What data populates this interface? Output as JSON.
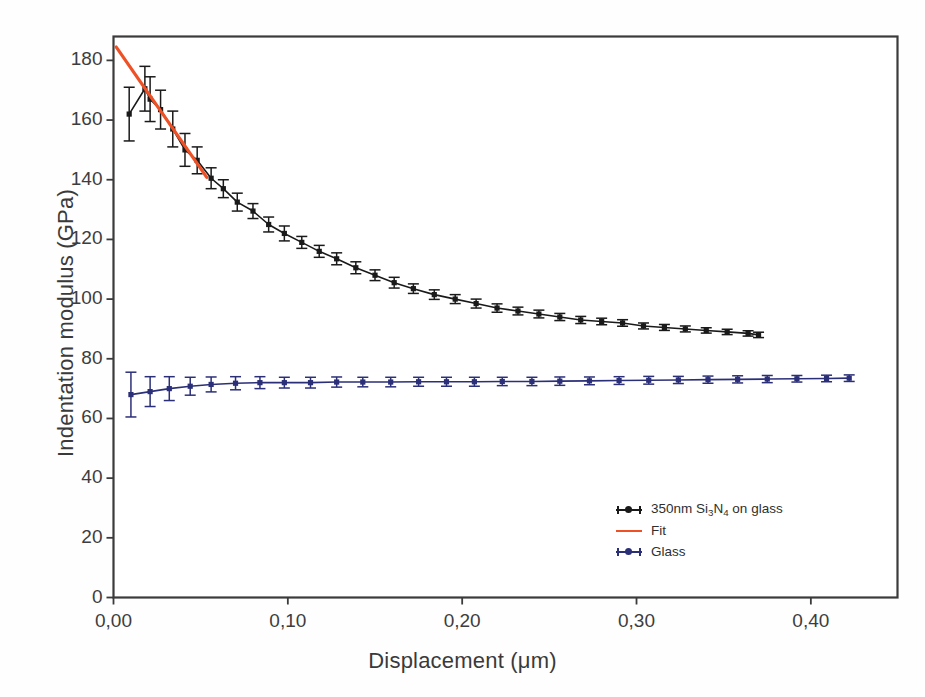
{
  "chart_data": {
    "type": "line",
    "title": "",
    "xlabel": "Displacement (μm)",
    "ylabel": "Indentation modulus (GPa)",
    "xlim": [
      0.0,
      0.4497
    ],
    "ylim": [
      0,
      188
    ],
    "xticks": [
      0.0,
      0.1,
      0.2,
      0.3,
      0.4
    ],
    "xticklabels": [
      "0,00",
      "0,10",
      "0,20",
      "0,30",
      "0,40"
    ],
    "yticks": [
      0,
      20,
      40,
      60,
      80,
      100,
      120,
      140,
      160,
      180
    ],
    "yticklabels": [
      "0",
      "20",
      "40",
      "60",
      "80",
      "100",
      "120",
      "140",
      "160",
      "180"
    ],
    "decimal_separator": ",",
    "grid": false,
    "legend_position": "lower-right-inside",
    "series": [
      {
        "name": "350nm Si3N4 on glass",
        "label_html": "350nm Si<sub>3</sub>N<sub>4</sub> on glass",
        "color": "#1a1a1a",
        "marker": "square",
        "has_error_bars": true,
        "x": [
          0.009,
          0.018,
          0.021,
          0.027,
          0.034,
          0.041,
          0.048,
          0.056,
          0.063,
          0.071,
          0.08,
          0.089,
          0.098,
          0.108,
          0.118,
          0.128,
          0.139,
          0.15,
          0.161,
          0.172,
          0.184,
          0.196,
          0.208,
          0.22,
          0.232,
          0.244,
          0.256,
          0.268,
          0.28,
          0.292,
          0.304,
          0.316,
          0.328,
          0.34,
          0.352,
          0.364,
          0.37
        ],
        "y": [
          162.0,
          170.5,
          167.0,
          163.5,
          157.0,
          150.0,
          146.5,
          140.5,
          137.0,
          132.5,
          129.5,
          125.0,
          122.0,
          119.0,
          116.0,
          113.5,
          110.5,
          108.0,
          105.5,
          103.5,
          101.5,
          100.0,
          98.5,
          97.0,
          96.0,
          95.0,
          94.0,
          93.0,
          92.5,
          92.0,
          91.0,
          90.5,
          90.0,
          89.5,
          89.0,
          88.5,
          88.0
        ],
        "yerr": [
          9.0,
          7.5,
          7.5,
          6.5,
          6.0,
          5.5,
          4.5,
          3.5,
          3.0,
          3.0,
          2.5,
          2.5,
          2.5,
          2.0,
          2.0,
          2.0,
          2.0,
          1.8,
          1.8,
          1.6,
          1.6,
          1.5,
          1.5,
          1.4,
          1.3,
          1.3,
          1.2,
          1.2,
          1.1,
          1.1,
          1.0,
          1.0,
          1.0,
          0.9,
          0.9,
          0.9,
          0.9
        ]
      },
      {
        "name": "Fit",
        "color": "#ef5127",
        "marker": "none",
        "has_error_bars": false,
        "x": [
          0.0015,
          0.0535
        ],
        "y": [
          184.5,
          140.8
        ]
      },
      {
        "name": "Glass",
        "color": "#2b2f78",
        "marker": "square",
        "has_error_bars": true,
        "x": [
          0.01,
          0.021,
          0.032,
          0.044,
          0.056,
          0.07,
          0.084,
          0.098,
          0.113,
          0.128,
          0.143,
          0.159,
          0.175,
          0.191,
          0.207,
          0.223,
          0.24,
          0.256,
          0.273,
          0.29,
          0.307,
          0.324,
          0.341,
          0.358,
          0.375,
          0.392,
          0.409,
          0.422
        ],
        "y": [
          68.0,
          69.0,
          70.0,
          70.8,
          71.4,
          71.8,
          72.0,
          72.0,
          72.0,
          72.2,
          72.2,
          72.2,
          72.3,
          72.3,
          72.3,
          72.4,
          72.4,
          72.5,
          72.6,
          72.7,
          72.8,
          72.9,
          73.0,
          73.1,
          73.2,
          73.3,
          73.4,
          73.5
        ],
        "yerr": [
          7.5,
          5.0,
          4.0,
          3.0,
          2.5,
          2.2,
          2.0,
          1.8,
          1.8,
          1.7,
          1.6,
          1.6,
          1.5,
          1.5,
          1.5,
          1.4,
          1.4,
          1.4,
          1.3,
          1.3,
          1.3,
          1.2,
          1.2,
          1.2,
          1.2,
          1.1,
          1.1,
          1.1
        ]
      }
    ]
  },
  "legend": {
    "items": [
      {
        "label": "350nm Si3N4 on glass",
        "color": "#1a1a1a",
        "style": "marker-line"
      },
      {
        "label": "Fit",
        "color": "#ef5127",
        "style": "line"
      },
      {
        "label": "Glass",
        "color": "#2b2f78",
        "style": "marker-line"
      }
    ]
  },
  "frame": {
    "color": "#3b3b3b",
    "background": "#ffffff"
  }
}
